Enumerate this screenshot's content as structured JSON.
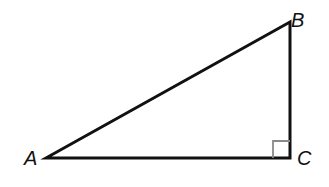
{
  "diagram": {
    "type": "right-triangle",
    "vertices": [
      {
        "name": "A",
        "x": 46,
        "y": 158,
        "label_x": 24,
        "label_y": 148
      },
      {
        "name": "B",
        "x": 290,
        "y": 22,
        "label_x": 291,
        "label_y": 10
      },
      {
        "name": "C",
        "x": 290,
        "y": 158,
        "label_x": 297,
        "label_y": 148
      }
    ],
    "right_angle_at": "C",
    "right_angle_marker_size": 17,
    "colors": {
      "stroke": "#111111",
      "right_angle_marker": "#8a8a8a",
      "background": "#ffffff"
    }
  },
  "labels": {
    "A": "A",
    "B": "B",
    "C": "C"
  }
}
